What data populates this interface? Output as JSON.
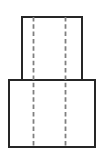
{
  "figure": {
    "kind": "orthographic-front-view",
    "background_color": "#ffffff",
    "canvas": {
      "width": 105,
      "height": 160
    },
    "caption": ""
  },
  "style": {
    "visible_edge_color": "#262626",
    "visible_edge_width": 2,
    "hidden_line_color": "#808080",
    "hidden_line_width": 1.8,
    "hidden_line_dash": "4.5 2.8",
    "face_fill": "#ffffff"
  },
  "shapes": [
    {
      "name": "upper-step-rectangle",
      "label": "Upper narrow step",
      "type": "rect",
      "x": 22,
      "y": 17,
      "width": 60,
      "height": 64
    },
    {
      "name": "lower-base-rectangle",
      "label": "Lower wide base",
      "type": "rect",
      "x": 9,
      "y": 80,
      "width": 86,
      "height": 67
    }
  ],
  "hidden_lines": [
    {
      "name": "left-hidden-centerline",
      "label": "Left hidden edge line",
      "x": 33.5,
      "y1": 17,
      "y2": 147
    },
    {
      "name": "right-hidden-centerline",
      "label": "Right hidden edge line",
      "x": 65.5,
      "y1": 17,
      "y2": 147
    }
  ]
}
